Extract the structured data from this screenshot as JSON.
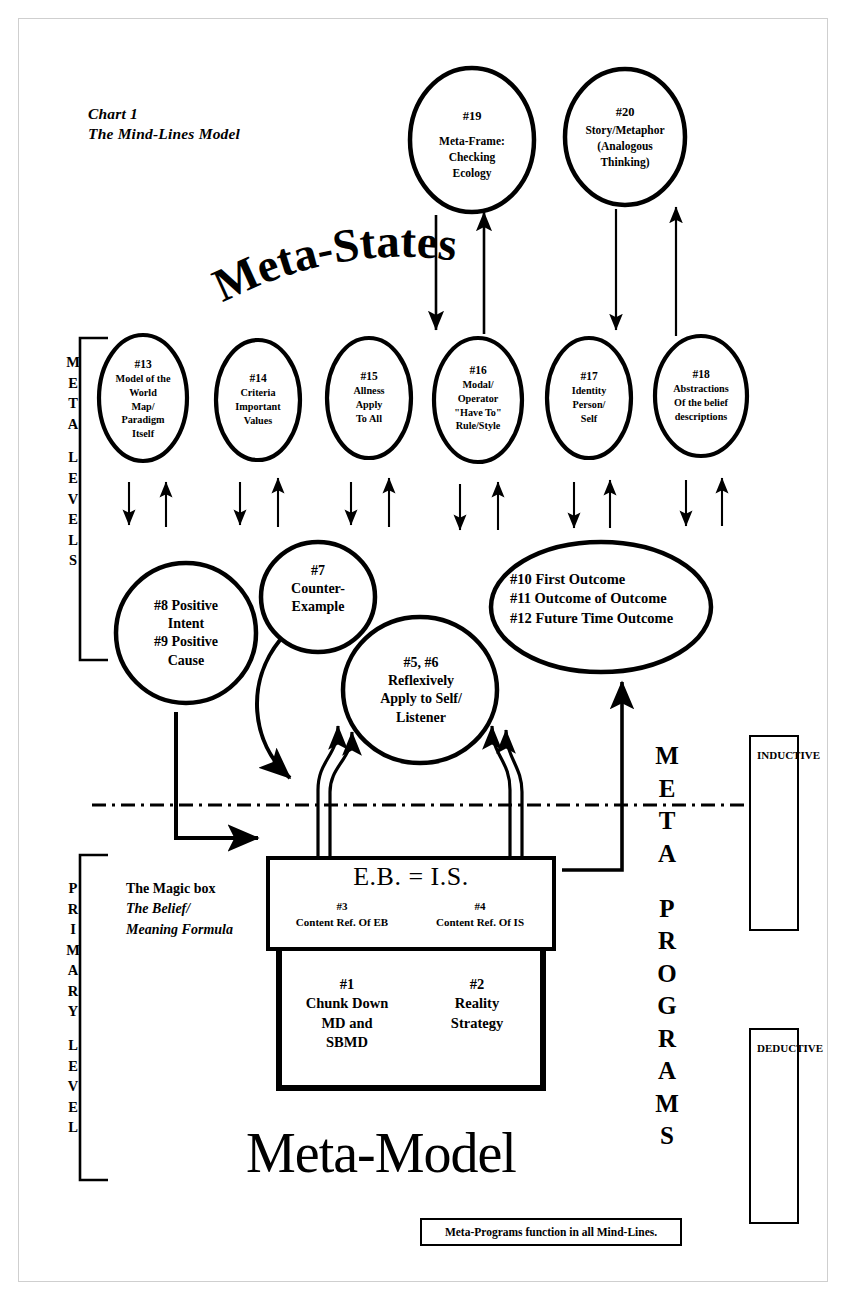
{
  "chart": {
    "title_line1": "Chart 1",
    "title_line2": "The Mind-Lines Model",
    "banner_meta_states": "Meta-States",
    "banner_meta_model": "Meta-Model",
    "footer_note": "Meta-Programs function in all Mind-Lines."
  },
  "side_labels": {
    "meta_levels": "META LEVELS",
    "primary_level": "PRIMARY LEVEL",
    "meta_programs": "META PROGRAMS",
    "inductive": "INDUCTIVE",
    "deductive": "DEDUCTIVE"
  },
  "top_circles": [
    {
      "num": "#19",
      "lines": [
        "Meta-Frame:",
        "Checking",
        "Ecology"
      ]
    },
    {
      "num": "#20",
      "lines": [
        "Story/Metaphor",
        "(Analogous",
        "Thinking)"
      ]
    }
  ],
  "meta_level_circles": [
    {
      "num": "#13",
      "lines": [
        "Model of the",
        "World",
        "Map/",
        "Paradigm",
        "Itself"
      ]
    },
    {
      "num": "#14",
      "lines": [
        "Criteria",
        "Important",
        "Values"
      ]
    },
    {
      "num": "#15",
      "lines": [
        "Allness",
        "Apply",
        "To All"
      ]
    },
    {
      "num": "#16",
      "lines": [
        "Modal/",
        "Operator",
        "\"Have To\"",
        "Rule/Style"
      ]
    },
    {
      "num": "#17",
      "lines": [
        "Identity",
        "Person/",
        "Self"
      ]
    },
    {
      "num": "#18",
      "lines": [
        "Abstractions",
        "Of the belief",
        "descriptions"
      ]
    }
  ],
  "mid_circles": {
    "positive": [
      "#8 Positive",
      "Intent",
      "#9 Positive",
      "Cause"
    ],
    "counter_example": [
      "#7",
      "Counter-",
      "Example"
    ],
    "reflexive": [
      "#5, #6",
      "Reflexively",
      "Apply to Self/",
      "Listener"
    ],
    "outcomes": [
      "#10 First Outcome",
      "#11 Outcome of Outcome",
      "#12 Future Time Outcome"
    ]
  },
  "magic_box": {
    "formula": "E.B.  =  I.S.",
    "ref_left_num": "#3",
    "ref_left_text": "Content Ref. Of EB",
    "ref_right_num": "#4",
    "ref_right_text": "Content Ref. Of IS",
    "primary_left_num": "#1",
    "primary_left_lines": [
      "Chunk Down",
      "MD and",
      "SBMD"
    ],
    "primary_right_num": "#2",
    "primary_right_lines": [
      "Reality",
      "Strategy"
    ],
    "note_line1": "The Magic box",
    "note_line2": "The Belief/",
    "note_line3": "Meaning Formula"
  },
  "colors": {
    "ink": "#000000",
    "paper": "#ffffff",
    "border": "#cfcfcf"
  }
}
